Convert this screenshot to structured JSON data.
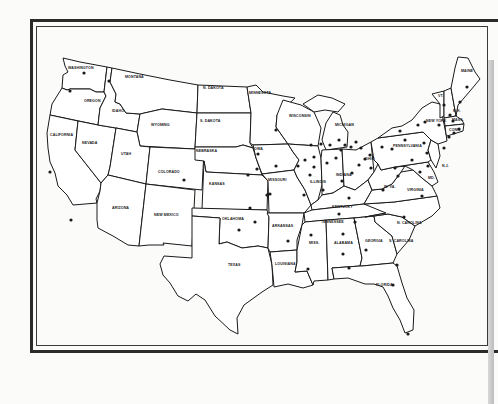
{
  "map": {
    "title": "United States map with marked locations",
    "dot_color": "#1a1a1a",
    "line_color": "#1a1a1a",
    "background": "#fbfbfa",
    "states": [
      {
        "name": "WASHINGTON",
        "x": 68,
        "y": 69
      },
      {
        "name": "OREGON",
        "x": 84,
        "y": 102
      },
      {
        "name": "CALIFORNIA",
        "x": 50,
        "y": 136
      },
      {
        "name": "NEVADA",
        "x": 82,
        "y": 144
      },
      {
        "name": "IDAHO",
        "x": 112,
        "y": 112
      },
      {
        "name": "MONTANA",
        "x": 125,
        "y": 78
      },
      {
        "name": "WYOMING",
        "x": 151,
        "y": 126
      },
      {
        "name": "UTAH",
        "x": 121,
        "y": 155
      },
      {
        "name": "ARIZONA",
        "x": 112,
        "y": 209
      },
      {
        "name": "COLORADO",
        "x": 158,
        "y": 173
      },
      {
        "name": "NEW MEXICO",
        "x": 154,
        "y": 216
      },
      {
        "name": "N. DAKOTA",
        "x": 203,
        "y": 89
      },
      {
        "name": "S. DAKOTA",
        "x": 200,
        "y": 122
      },
      {
        "name": "NEBRASKA",
        "x": 196,
        "y": 152
      },
      {
        "name": "KANSAS",
        "x": 209,
        "y": 185
      },
      {
        "name": "OKLAHOMA",
        "x": 222,
        "y": 220
      },
      {
        "name": "TEXAS",
        "x": 228,
        "y": 266
      },
      {
        "name": "MINNESOTA",
        "x": 249,
        "y": 94
      },
      {
        "name": "IOWA",
        "x": 253,
        "y": 150
      },
      {
        "name": "MISSOURI",
        "x": 268,
        "y": 181
      },
      {
        "name": "ARKANSAS",
        "x": 272,
        "y": 227
      },
      {
        "name": "LOUISIANA",
        "x": 275,
        "y": 265
      },
      {
        "name": "WISCONSIN",
        "x": 289,
        "y": 117
      },
      {
        "name": "ILLINOIS",
        "x": 310,
        "y": 183
      },
      {
        "name": "MICHIGAN",
        "x": 335,
        "y": 126
      },
      {
        "name": "INDIANA",
        "x": 336,
        "y": 176
      },
      {
        "name": "OHIO",
        "x": 365,
        "y": 160
      },
      {
        "name": "KENTUCKY",
        "x": 332,
        "y": 208
      },
      {
        "name": "TENNESSEE",
        "x": 321,
        "y": 223
      },
      {
        "name": "MISS.",
        "x": 309,
        "y": 244
      },
      {
        "name": "ALABAMA",
        "x": 334,
        "y": 244
      },
      {
        "name": "GEORGIA",
        "x": 365,
        "y": 242
      },
      {
        "name": "FLORIDA",
        "x": 376,
        "y": 286
      },
      {
        "name": "S. CAROLINA",
        "x": 389,
        "y": 242
      },
      {
        "name": "N. CAROLINA",
        "x": 397,
        "y": 224
      },
      {
        "name": "VIRGINIA",
        "x": 407,
        "y": 191
      },
      {
        "name": "W. VA.",
        "x": 384,
        "y": 188
      },
      {
        "name": "PENNSYLVANIA",
        "x": 393,
        "y": 147
      },
      {
        "name": "NEW YORK",
        "x": 426,
        "y": 122
      },
      {
        "name": "VT.",
        "x": 438,
        "y": 97
      },
      {
        "name": "N.H.",
        "x": 453,
        "y": 112
      },
      {
        "name": "MAINE",
        "x": 461,
        "y": 72
      },
      {
        "name": "MASS.",
        "x": 452,
        "y": 121
      },
      {
        "name": "CONN.",
        "x": 449,
        "y": 131
      },
      {
        "name": "N.J.",
        "x": 442,
        "y": 167
      },
      {
        "name": "MD.",
        "x": 428,
        "y": 179
      }
    ],
    "location_count": 92
  }
}
